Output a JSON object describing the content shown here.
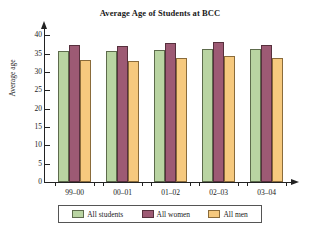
{
  "chart_data": {
    "type": "bar",
    "title": "Average Age of Students at BCC",
    "xlabel": "",
    "ylabel": "Average age",
    "categories": [
      "99–00",
      "00–01",
      "01–02",
      "02–03",
      "03–04"
    ],
    "series": [
      {
        "name": "All students",
        "color": "#b9d4a2",
        "values": [
          35.7,
          35.8,
          36.1,
          36.2,
          36.2
        ]
      },
      {
        "name": "All women",
        "color": "#9d5a74",
        "values": [
          37.3,
          37.2,
          38.0,
          38.1,
          37.3
        ]
      },
      {
        "name": "All men",
        "color": "#f6c97e",
        "values": [
          33.2,
          33.1,
          33.9,
          34.3,
          33.9
        ]
      }
    ],
    "ylim": [
      0,
      42
    ],
    "yticks": [
      0,
      5,
      10,
      15,
      20,
      25,
      30,
      35,
      40
    ],
    "ytick_labels": [
      "0",
      "5",
      "10",
      "15",
      "20",
      "25",
      "30",
      "35",
      "40"
    ],
    "grid": false,
    "legend_position": "bottom"
  },
  "legend": {
    "items": [
      {
        "label": "All students"
      },
      {
        "label": "All women"
      },
      {
        "label": "All men"
      }
    ]
  }
}
